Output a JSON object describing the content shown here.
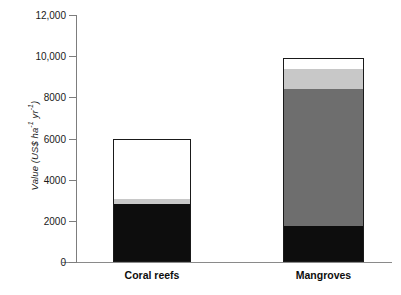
{
  "chart_data": {
    "type": "bar",
    "title": "",
    "subtitle": "",
    "xlabel": "",
    "ylabel": "Value (US$ ha-1 yr-1)",
    "ylabel_parts": {
      "prefix": "Value (US$ ha",
      "sup1": "-1",
      "middle": " yr",
      "sup2": "-1",
      "suffix": ")"
    },
    "categories": [
      "Coral reefs",
      "Mangroves"
    ],
    "ylim": [
      0,
      12000
    ],
    "yticks": [
      0,
      2000,
      4000,
      6000,
      8000,
      10000,
      12000
    ],
    "ytick_labels": [
      "0",
      "2000",
      "4000",
      "6000",
      "8000",
      "10,000",
      "12,000"
    ],
    "grid": false,
    "legend": "none",
    "stacked": true,
    "series": [
      {
        "name": "black-segment",
        "color": "#0d0d0d",
        "values": [
          2800,
          1700
        ]
      },
      {
        "name": "dark-gray-segment",
        "color": "#6e6e6e",
        "values": [
          0,
          6750
        ]
      },
      {
        "name": "light-gray-segment",
        "color": "#c8c8c8",
        "values": [
          250,
          970
        ]
      },
      {
        "name": "white-segment",
        "color": "#ffffff",
        "values": [
          2950,
          480
        ]
      }
    ],
    "totals": [
      6000,
      9900
    ]
  },
  "axis": {
    "tick_labels": [
      "12,000",
      "10,000",
      "8000",
      "6000",
      "4000",
      "2000",
      "0"
    ],
    "tick_values": [
      12000,
      10000,
      8000,
      6000,
      4000,
      2000,
      0
    ]
  },
  "bars": [
    {
      "label": "Coral reefs",
      "total": 6000,
      "segments": [
        {
          "name": "white-segment",
          "value": 2950,
          "color": "#ffffff"
        },
        {
          "name": "light-gray-segment",
          "value": 250,
          "color": "#c8c8c8"
        },
        {
          "name": "black-segment",
          "value": 2800,
          "color": "#0d0d0d"
        }
      ]
    },
    {
      "label": "Mangroves",
      "total": 9900,
      "segments": [
        {
          "name": "white-segment",
          "value": 480,
          "color": "#ffffff"
        },
        {
          "name": "light-gray-segment",
          "value": 970,
          "color": "#c8c8c8"
        },
        {
          "name": "dark-gray-segment",
          "value": 6750,
          "color": "#6e6e6e"
        },
        {
          "name": "black-segment",
          "value": 1700,
          "color": "#0d0d0d"
        }
      ]
    }
  ]
}
